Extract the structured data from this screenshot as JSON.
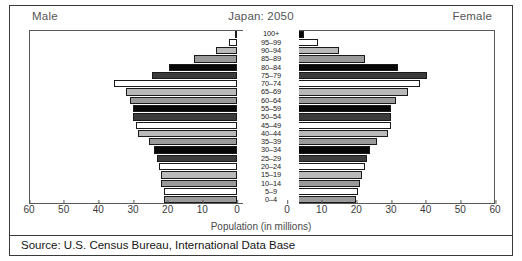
{
  "header": {
    "male_label": "Male",
    "title": "Japan: 2050",
    "female_label": "Female"
  },
  "axis": {
    "xlabel": "Population (in millions)",
    "left_ticks": [
      "60",
      "50",
      "40",
      "30",
      "20",
      "10",
      "0"
    ],
    "right_ticks": [
      "0",
      "10",
      "20",
      "30",
      "40",
      "50",
      "60"
    ]
  },
  "source": "Source: U.S. Census Bureau, International Data Base",
  "colors": {
    "white": "#ffffff",
    "light": "#b9b9b9",
    "mid": "#9a9a9a",
    "black": "#070707",
    "dark": "#3b3b3b",
    "frame": "#3a3a3a"
  },
  "chart_data": {
    "type": "bar",
    "subtype": "population-pyramid",
    "title": "Japan: 2050",
    "xlabel": "Population (in millions)",
    "ylabel": "",
    "xlim": [
      0,
      60
    ],
    "grid": false,
    "legend": "none",
    "left_series_name": "Male",
    "right_series_name": "Female",
    "categories": [
      "100+",
      "95–99",
      "90–94",
      "85–89",
      "80–84",
      "75–79",
      "70–74",
      "65–69",
      "60–64",
      "55–59",
      "50–54",
      "45–49",
      "40–44",
      "35–39",
      "30–34",
      "25–29",
      "20–24",
      "15–19",
      "10–14",
      "5–9",
      "0–4"
    ],
    "series": [
      {
        "name": "Male",
        "values": [
          0.6,
          2.2,
          6.0,
          12.5,
          19.5,
          24.5,
          35.5,
          32.0,
          31.0,
          30.0,
          30.0,
          29.0,
          28.5,
          25.5,
          24.0,
          23.0,
          22.5,
          22.0,
          22.0,
          21.0,
          21.0
        ]
      },
      {
        "name": "Female",
        "values": [
          5.0,
          9.0,
          15.0,
          22.5,
          32.0,
          40.5,
          38.5,
          35.0,
          31.5,
          30.0,
          30.0,
          30.0,
          29.0,
          26.0,
          24.0,
          23.0,
          22.5,
          21.5,
          21.0,
          20.5,
          20.0
        ]
      }
    ],
    "fill_pattern": [
      "black",
      "white",
      "light",
      "mid",
      "black",
      "dark",
      "white",
      "light",
      "mid",
      "black",
      "dark",
      "white",
      "light",
      "mid",
      "black",
      "dark",
      "white",
      "light",
      "mid",
      "white",
      "mid"
    ]
  }
}
